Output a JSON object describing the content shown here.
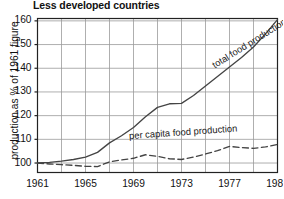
{
  "chart_data": {
    "type": "line",
    "title": "Less developed countries",
    "xlabel": "",
    "ylabel": "production as % of 1961 figure",
    "xlim": [
      1961,
      1981
    ],
    "ylim": [
      96,
      161
    ],
    "grid": true,
    "legend_position": "inline-annotation",
    "xticks": [
      "1961",
      "1965",
      "1969",
      "1973",
      "1977",
      "1981"
    ],
    "xtick_values": [
      1961,
      1965,
      1969,
      1973,
      1977,
      1981
    ],
    "gridline_x_values": [
      1961,
      1963,
      1965,
      1967,
      1969,
      1971,
      1973,
      1975,
      1977,
      1979,
      1981
    ],
    "yticks": [
      "100",
      "110",
      "120",
      "130",
      "140",
      "150",
      "160"
    ],
    "ytick_values": [
      100,
      110,
      120,
      130,
      140,
      150,
      160
    ],
    "x": [
      1961,
      1962,
      1963,
      1964,
      1965,
      1966,
      1967,
      1968,
      1969,
      1970,
      1971,
      1972,
      1973,
      1974,
      1975,
      1976,
      1977,
      1978,
      1979,
      1980,
      1981
    ],
    "series": [
      {
        "name": "total food production",
        "style": "solid",
        "color": "#444444",
        "values": [
          100.0,
          100.3,
          100.8,
          101.5,
          102.5,
          104.5,
          108.5,
          111.5,
          115.0,
          119.5,
          123.5,
          125.0,
          125.2,
          128.5,
          132.5,
          136.5,
          140.5,
          144.5,
          149.0,
          154.5,
          160.5
        ]
      },
      {
        "name": "per capita food production",
        "style": "dashed",
        "color": "#444444",
        "values": [
          100.0,
          99.6,
          99.3,
          99.0,
          98.6,
          98.5,
          100.5,
          101.3,
          102.0,
          103.5,
          102.8,
          101.8,
          101.5,
          102.5,
          103.8,
          105.2,
          107.0,
          106.5,
          106.2,
          106.8,
          107.8
        ]
      }
    ],
    "annotations": [
      {
        "text": "total food production",
        "x": 1975.6,
        "y": 141.0,
        "rotation": -32
      },
      {
        "text": "per capita food production",
        "x": 1968.6,
        "y": 111.6,
        "rotation": -4
      }
    ]
  }
}
